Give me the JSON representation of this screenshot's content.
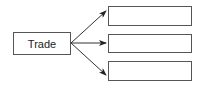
{
  "diagram": {
    "source": {
      "label": "Trade"
    },
    "targets": [
      {
        "label": ""
      },
      {
        "label": ""
      },
      {
        "label": ""
      }
    ],
    "colors": {
      "stroke": "#333333",
      "border": "#555555",
      "background": "#ffffff"
    }
  }
}
